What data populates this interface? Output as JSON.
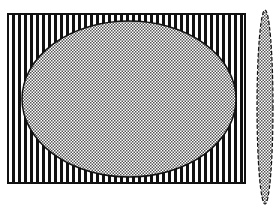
{
  "figure": {
    "colors": {
      "background": "#ffffff",
      "ink": "#111111",
      "stripe_light": "#ffffff",
      "dot_fill": "#c8c8c8"
    },
    "rectangle": {
      "x": 8,
      "y": 14,
      "width": 237,
      "height": 169,
      "pattern": "vertical-stripes"
    },
    "inner_ellipse": {
      "cx": 129,
      "cy": 99,
      "rx": 107,
      "ry": 78,
      "pattern": "dots"
    },
    "side_ellipse": {
      "cx": 265,
      "cy": 107,
      "rx": 8,
      "ry": 97,
      "pattern": "dots",
      "outline": "dashed"
    }
  }
}
